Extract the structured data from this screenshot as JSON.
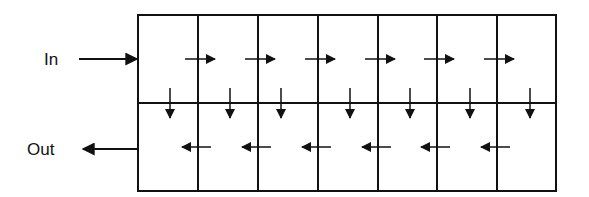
{
  "labels": {
    "in": "In",
    "out": "Out"
  },
  "colors": {
    "stroke": "#111111",
    "background": "#ffffff"
  },
  "grid": {
    "rows": 2,
    "columns": 7,
    "left": 138,
    "top": 15,
    "right": 556,
    "bottom": 191,
    "middle": 103,
    "column_lines": [
      198,
      258,
      318,
      378,
      437,
      497
    ]
  },
  "flow": {
    "input_arrow": {
      "x1": 79,
      "x2": 137,
      "y": 59,
      "direction": "right"
    },
    "output_arrow": {
      "x1": 138,
      "x2": 83,
      "y": 149,
      "direction": "left"
    },
    "top_row_arrows": [
      {
        "x1": 185,
        "x2": 215,
        "y": 59
      },
      {
        "x1": 245,
        "x2": 275,
        "y": 59
      },
      {
        "x1": 305,
        "x2": 335,
        "y": 59
      },
      {
        "x1": 365,
        "x2": 395,
        "y": 59
      },
      {
        "x1": 424,
        "x2": 454,
        "y": 59
      },
      {
        "x1": 484,
        "x2": 514,
        "y": 59
      }
    ],
    "down_arrows": [
      {
        "x": 170,
        "y1": 88,
        "y2": 118
      },
      {
        "x": 230,
        "y1": 88,
        "y2": 118
      },
      {
        "x": 281,
        "y1": 88,
        "y2": 118
      },
      {
        "x": 350,
        "y1": 88,
        "y2": 118
      },
      {
        "x": 410,
        "y1": 88,
        "y2": 118
      },
      {
        "x": 470,
        "y1": 88,
        "y2": 118
      },
      {
        "x": 530,
        "y1": 88,
        "y2": 118
      }
    ],
    "bottom_row_arrows": [
      {
        "x1": 211,
        "x2": 182,
        "y": 147
      },
      {
        "x1": 271,
        "x2": 242,
        "y": 147
      },
      {
        "x1": 331,
        "x2": 302,
        "y": 147
      },
      {
        "x1": 391,
        "x2": 362,
        "y": 147
      },
      {
        "x1": 450,
        "x2": 421,
        "y": 147
      },
      {
        "x1": 510,
        "x2": 481,
        "y": 147
      }
    ]
  }
}
